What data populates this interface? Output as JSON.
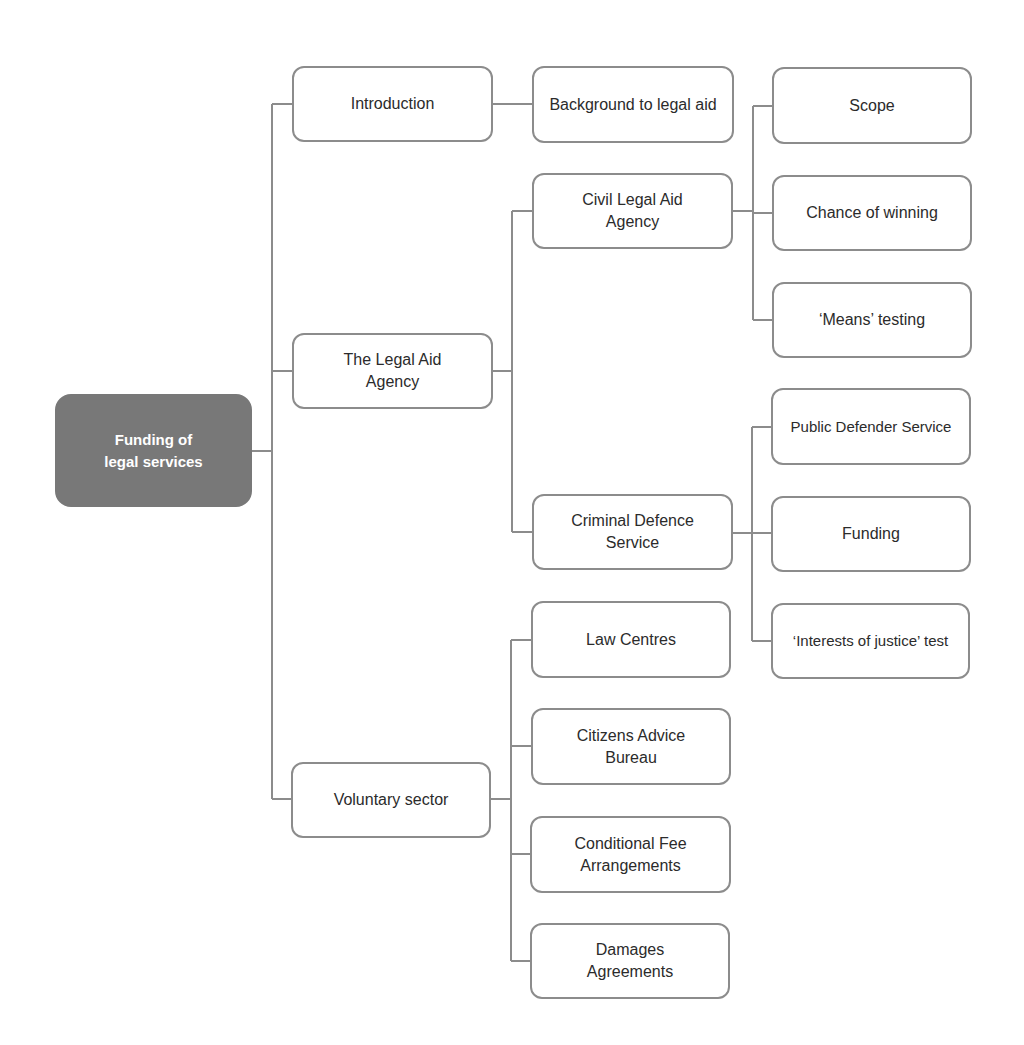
{
  "diagram": {
    "title": "Funding of legal services",
    "colors": {
      "root_fill": "#787878",
      "root_text": "#ffffff",
      "node_border": "#8c8c8c",
      "connector": "#8c8c8c",
      "text": "#2b2b2b"
    },
    "root": {
      "label": "Funding of legal services"
    },
    "level1": [
      {
        "id": "introduction",
        "label": "Introduction"
      },
      {
        "id": "legal-aid-agency",
        "label": "The Legal Aid Agency"
      },
      {
        "id": "voluntary-sector",
        "label": "Voluntary sector"
      }
    ],
    "level2": [
      {
        "id": "background",
        "parent": "introduction",
        "label": "Background to legal aid"
      },
      {
        "id": "civil",
        "parent": "legal-aid-agency",
        "label": "Civil Legal Aid Agency"
      },
      {
        "id": "criminal",
        "parent": "legal-aid-agency",
        "label": "Criminal Defence Service"
      },
      {
        "id": "law-centres",
        "parent": "voluntary-sector",
        "label": "Law Centres"
      },
      {
        "id": "cab",
        "parent": "voluntary-sector",
        "label": "Citizens Advice Bureau"
      },
      {
        "id": "cfa",
        "parent": "voluntary-sector",
        "label": "Conditional Fee Arrangements"
      },
      {
        "id": "dba",
        "parent": "voluntary-sector",
        "label": "Damages Agreements"
      }
    ],
    "level3": [
      {
        "id": "scope",
        "parent": "civil",
        "label": "Scope"
      },
      {
        "id": "chance",
        "parent": "civil",
        "label": "Chance of winning"
      },
      {
        "id": "means",
        "parent": "civil",
        "label": "‘Means’ testing"
      },
      {
        "id": "pds",
        "parent": "criminal",
        "label": "Public Defender Service"
      },
      {
        "id": "funding",
        "parent": "criminal",
        "label": "Funding"
      },
      {
        "id": "ioj",
        "parent": "criminal",
        "label": "‘Interests of justice’ test"
      }
    ]
  }
}
